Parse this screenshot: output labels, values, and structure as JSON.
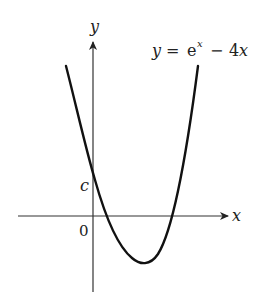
{
  "figure": {
    "equation_label": {
      "y": "y",
      "equals": "=",
      "base": "e",
      "exponent": "x",
      "minus": "−",
      "term": "4",
      "var": "x"
    },
    "axes": {
      "x_label": "x",
      "y_label": "y",
      "origin_label": "0",
      "intercept_label": "c"
    },
    "colors": {
      "stroke": "#111111",
      "axis": "#333333",
      "background": "#ffffff"
    }
  }
}
